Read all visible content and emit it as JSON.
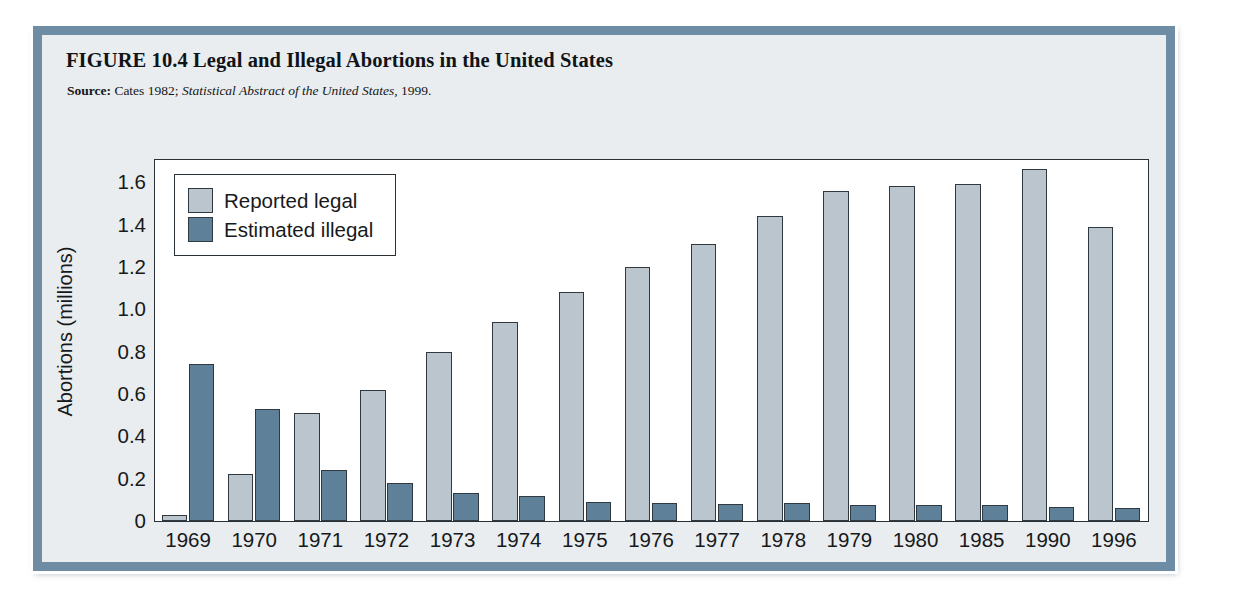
{
  "figure": {
    "title": "FIGURE 10.4  Legal and Illegal Abortions in the United States",
    "source_label": "Source:",
    "source_text_1": "Cates 1982;",
    "source_text_italic": "Statistical Abstract of the United States,",
    "source_text_2": "1999."
  },
  "legend": {
    "items": [
      {
        "label": "Reported legal",
        "color": "#bac5cd",
        "key": "legal"
      },
      {
        "label": "Estimated illegal",
        "color": "#5e8199",
        "key": "illegal"
      }
    ]
  },
  "chart_data": {
    "type": "bar",
    "title": "Legal and Illegal Abortions in the United States",
    "xlabel": "",
    "ylabel": "Abortions (millions)",
    "ylim": [
      0,
      1.7
    ],
    "yticks": [
      0,
      0.2,
      0.4,
      0.6,
      0.8,
      1.0,
      1.2,
      1.4,
      1.6
    ],
    "ytick_labels": [
      "0",
      "0.2",
      "0.4",
      "0.6",
      "0.8",
      "1.0",
      "1.2",
      "1.4",
      "1.6"
    ],
    "grid": false,
    "legend_position": "upper-left-inside",
    "categories": [
      "1969",
      "1970",
      "1971",
      "1972",
      "1973",
      "1974",
      "1975",
      "1976",
      "1977",
      "1978",
      "1979",
      "1980",
      "1985",
      "1990",
      "1996"
    ],
    "series": [
      {
        "name": "Reported legal",
        "color": "#bac5cd",
        "values": [
          0.03,
          0.22,
          0.51,
          0.62,
          0.8,
          0.94,
          1.08,
          1.2,
          1.31,
          1.44,
          1.56,
          1.58,
          1.59,
          1.66,
          1.39
        ]
      },
      {
        "name": "Estimated illegal",
        "color": "#5e8199",
        "values": [
          0.74,
          0.53,
          0.24,
          0.18,
          0.13,
          0.12,
          0.09,
          0.085,
          0.08,
          0.085,
          0.075,
          0.075,
          0.075,
          0.065,
          0.06
        ]
      }
    ]
  },
  "colors": {
    "frame_border": "#6f8ca5",
    "frame_fill": "#e9edef",
    "plot_background": "#ffffff",
    "axis": "#2a3136",
    "legal_bar": "#bac5cd",
    "illegal_bar": "#5e8199"
  }
}
